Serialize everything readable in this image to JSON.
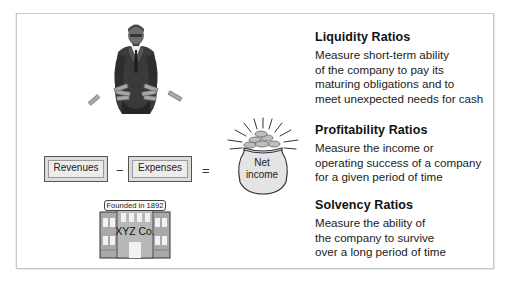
{
  "ratios": [
    {
      "heading": "Liquidity Ratios",
      "lines": [
        "Measure short-term ability",
        "of the company to pay its",
        "maturing obligations and to",
        "meet unexpected needs for cash"
      ]
    },
    {
      "heading": "Profitability Ratios",
      "lines": [
        "Measure the income or",
        "operating success of a company",
        "for a given period of time"
      ]
    },
    {
      "heading": "Solvency Ratios",
      "lines": [
        "Measure the ability of",
        "the company to survive",
        "over a long period of time"
      ]
    }
  ],
  "equation": {
    "revenues": "Revenues",
    "minus": "−",
    "expenses": "Expenses",
    "equals": "=",
    "result_line1": "Net",
    "result_line2": "income"
  },
  "building": {
    "sign": "Founded in 1892",
    "name": "XYZ Co."
  },
  "icons": {
    "liquidity": "businessman-dropping-money-icon",
    "profitability": "money-bag-icon",
    "solvency": "company-building-icon"
  },
  "colors": {
    "border": "#c9c9c9",
    "text": "#1a1a1a",
    "illustration_gray": "#9a9a9a",
    "illustration_dark": "#2f2f2f"
  }
}
